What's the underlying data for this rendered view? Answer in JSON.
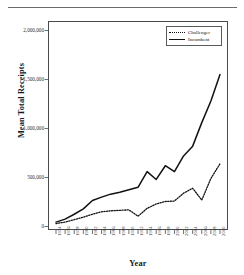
{
  "figure": {
    "has_top_rule": true
  },
  "chart_data": {
    "type": "line",
    "title": "",
    "xlabel": "Year",
    "ylabel": "Mean Total Receipts",
    "x": [
      1974,
      1976,
      1978,
      1980,
      1982,
      1984,
      1986,
      1988,
      1990,
      1992,
      1994,
      1996,
      1998,
      2000,
      2002,
      2004,
      2006,
      2008,
      2010
    ],
    "categories": [
      "1974",
      "1976",
      "1978",
      "1980",
      "1982",
      "1984",
      "1986",
      "1988",
      "1990",
      "1992",
      "1994",
      "1996",
      "1998",
      "2000",
      "2002",
      "2004",
      "2006",
      "2008",
      "2010"
    ],
    "series": [
      {
        "name": "Incumbent",
        "style": "solid",
        "color": "#111111",
        "values": [
          45000,
          75000,
          125000,
          180000,
          265000,
          300000,
          330000,
          350000,
          375000,
          400000,
          560000,
          480000,
          620000,
          560000,
          720000,
          820000,
          1060000,
          1280000,
          1550000
        ]
      },
      {
        "name": "Challenger",
        "style": "dotted",
        "color": "#111111",
        "values": [
          30000,
          45000,
          70000,
          95000,
          125000,
          150000,
          160000,
          165000,
          170000,
          105000,
          185000,
          230000,
          255000,
          260000,
          340000,
          390000,
          270000,
          490000,
          640000
        ]
      }
    ],
    "ylim": [
      0,
      2000000
    ],
    "yticks": [
      0,
      500000,
      1000000,
      1500000,
      2000000
    ],
    "ytick_labels": [
      "0",
      "500,000",
      "1,000,000",
      "1,500,000",
      "2,000,000"
    ],
    "grid": false,
    "legend_position": "top-right",
    "legend_entries": [
      {
        "label": "Challenger",
        "style": "dotted"
      },
      {
        "label": "Incumbent",
        "style": "solid"
      }
    ]
  }
}
